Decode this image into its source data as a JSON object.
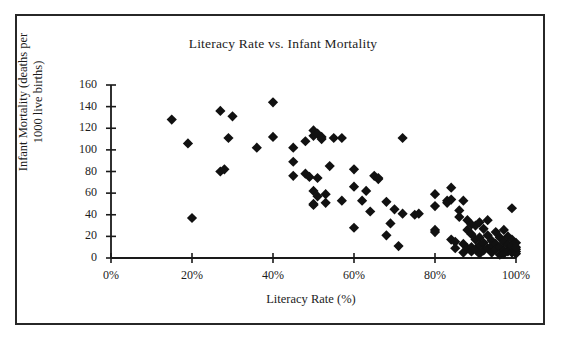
{
  "chart_data": {
    "type": "scatter",
    "title": "Literacy Rate vs. Infant Mortality",
    "xlabel": "Literacy Rate (%)",
    "ylabel_line1": "Infant Mortality (deaths per",
    "ylabel_line2": "1000 live births)",
    "xlim": [
      0,
      100
    ],
    "ylim": [
      0,
      160
    ],
    "xticks": [
      0,
      20,
      40,
      60,
      80,
      100
    ],
    "xtick_labels": [
      "0%",
      "20%",
      "40%",
      "60%",
      "80%",
      "100%"
    ],
    "yticks": [
      0,
      20,
      40,
      60,
      80,
      100,
      120,
      140,
      160
    ],
    "ytick_labels": [
      "0",
      "20",
      "40",
      "60",
      "80",
      "100",
      "120",
      "140",
      "160"
    ],
    "grid": false,
    "legend": false,
    "marker": "diamond",
    "marker_color": "#111111",
    "marker_size": 7,
    "points": [
      [
        15,
        128
      ],
      [
        19,
        106
      ],
      [
        20,
        37
      ],
      [
        27,
        136
      ],
      [
        27,
        80
      ],
      [
        28,
        82
      ],
      [
        29,
        111
      ],
      [
        30,
        131
      ],
      [
        36,
        102
      ],
      [
        40,
        144
      ],
      [
        40,
        112
      ],
      [
        45,
        102
      ],
      [
        45,
        89
      ],
      [
        45,
        76
      ],
      [
        48,
        108
      ],
      [
        48,
        78
      ],
      [
        49,
        75
      ],
      [
        50,
        118
      ],
      [
        50,
        113
      ],
      [
        50,
        62
      ],
      [
        50,
        50
      ],
      [
        50,
        49
      ],
      [
        51,
        115
      ],
      [
        51,
        74
      ],
      [
        51,
        57
      ],
      [
        52,
        112
      ],
      [
        52,
        110
      ],
      [
        53,
        59
      ],
      [
        53,
        51
      ],
      [
        54,
        85
      ],
      [
        55,
        111
      ],
      [
        57,
        111
      ],
      [
        57,
        53
      ],
      [
        60,
        82
      ],
      [
        60,
        66
      ],
      [
        60,
        28
      ],
      [
        62,
        53
      ],
      [
        63,
        62
      ],
      [
        64,
        43
      ],
      [
        65,
        76
      ],
      [
        66,
        73
      ],
      [
        66,
        74
      ],
      [
        68,
        52
      ],
      [
        68,
        21
      ],
      [
        69,
        32
      ],
      [
        70,
        45
      ],
      [
        71,
        11
      ],
      [
        72,
        111
      ],
      [
        72,
        41
      ],
      [
        75,
        40
      ],
      [
        76,
        41
      ],
      [
        80,
        59
      ],
      [
        80,
        48
      ],
      [
        80,
        26
      ],
      [
        80,
        24
      ],
      [
        83,
        53
      ],
      [
        83,
        51
      ],
      [
        84,
        65
      ],
      [
        84,
        54
      ],
      [
        84,
        17
      ],
      [
        85,
        15
      ],
      [
        85,
        9
      ],
      [
        86,
        44
      ],
      [
        86,
        38
      ],
      [
        87,
        53
      ],
      [
        87,
        13
      ],
      [
        87,
        5
      ],
      [
        88,
        35
      ],
      [
        88,
        26
      ],
      [
        88,
        9
      ],
      [
        89,
        31
      ],
      [
        89,
        22
      ],
      [
        89,
        10
      ],
      [
        89,
        6
      ],
      [
        90,
        30
      ],
      [
        90,
        17
      ],
      [
        90,
        8
      ],
      [
        91,
        33
      ],
      [
        91,
        19
      ],
      [
        91,
        12
      ],
      [
        91,
        4
      ],
      [
        92,
        27
      ],
      [
        92,
        14
      ],
      [
        92,
        7
      ],
      [
        93,
        35
      ],
      [
        93,
        21
      ],
      [
        93,
        9
      ],
      [
        94,
        16
      ],
      [
        94,
        11
      ],
      [
        94,
        5
      ],
      [
        95,
        24
      ],
      [
        95,
        13
      ],
      [
        95,
        8
      ],
      [
        96,
        19
      ],
      [
        96,
        10
      ],
      [
        96,
        3
      ],
      [
        97,
        26
      ],
      [
        97,
        15
      ],
      [
        97,
        7
      ],
      [
        97,
        4
      ],
      [
        98,
        20
      ],
      [
        98,
        12
      ],
      [
        98,
        6
      ],
      [
        99,
        46
      ],
      [
        99,
        17
      ],
      [
        99,
        9
      ],
      [
        99,
        5
      ],
      [
        99,
        11
      ],
      [
        100,
        14
      ],
      [
        100,
        8
      ],
      [
        100,
        6
      ],
      [
        100,
        4
      ],
      [
        100,
        10
      ]
    ]
  }
}
